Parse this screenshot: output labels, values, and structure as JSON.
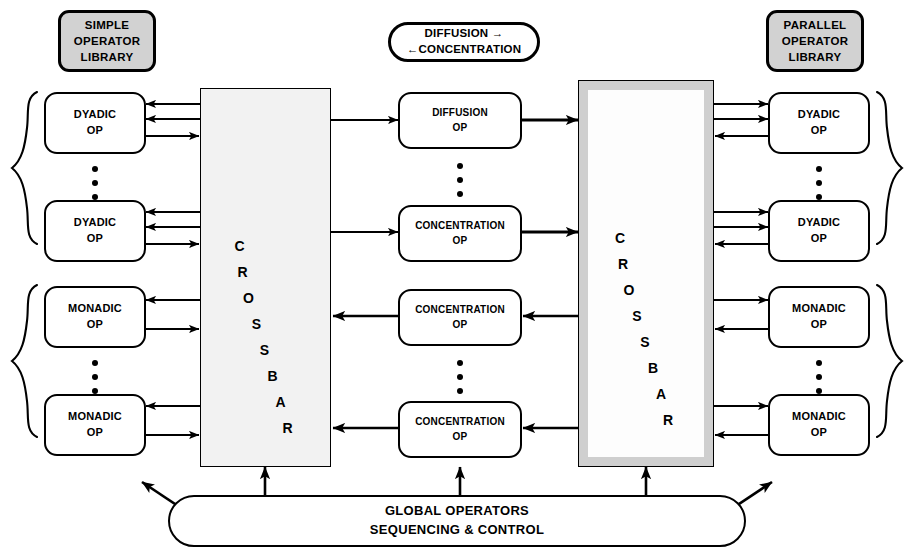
{
  "diagram": {
    "title_left": {
      "lines": [
        "SIMPLE",
        "OPERATOR",
        "LIBRARY"
      ]
    },
    "title_right": {
      "lines": [
        "PARALLEL",
        "OPERATOR",
        "LIBRARY"
      ]
    },
    "legend": {
      "lines": [
        "DIFFUSION  →",
        "←CONCENTRATION"
      ]
    },
    "crossbar_left": {
      "letters": [
        "C",
        "R",
        "O",
        "S",
        "S",
        "B",
        "A",
        "R"
      ]
    },
    "crossbar_right": {
      "letters": [
        "C",
        "R",
        "O",
        "S",
        "S",
        "B",
        "A",
        "R"
      ]
    },
    "global_bar": {
      "lines": [
        "GLOBAL OPERATORS",
        "SEQUENCING & CONTROL"
      ]
    },
    "left_ops": [
      {
        "lines": [
          "DYADIC",
          "OP"
        ]
      },
      {
        "lines": [
          "DYADIC",
          "OP"
        ]
      },
      {
        "lines": [
          "MONADIC",
          "OP"
        ]
      },
      {
        "lines": [
          "MONADIC",
          "OP"
        ]
      }
    ],
    "center_ops": [
      {
        "lines": [
          "DIFFUSION",
          "OP"
        ]
      },
      {
        "lines": [
          "CONCENTRATION",
          "OP"
        ]
      },
      {
        "lines": [
          "CONCENTRATION",
          "OP"
        ]
      },
      {
        "lines": [
          "CONCENTRATION",
          "OP"
        ]
      }
    ],
    "right_ops": [
      {
        "lines": [
          "DYADIC",
          "OP"
        ]
      },
      {
        "lines": [
          "DYADIC",
          "OP"
        ]
      },
      {
        "lines": [
          "MONADIC",
          "OP"
        ]
      },
      {
        "lines": [
          "MONADIC",
          "OP"
        ]
      }
    ],
    "colors": {
      "ink": "#000000",
      "header_fill": "#d2d2d2",
      "crossbar_border_fill": "#cfcfcf",
      "crossbar_inner_fill": "#fdfdfd",
      "page": "#ffffff"
    }
  }
}
